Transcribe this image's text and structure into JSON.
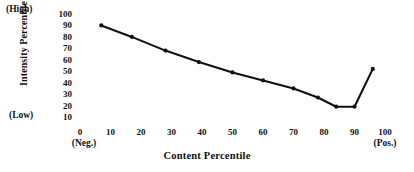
{
  "chart_data": {
    "type": "line",
    "title": "",
    "xlabel": "Content Percentile",
    "ylabel": "Intensity Percentile",
    "xlim": [
      0,
      100
    ],
    "ylim": [
      10,
      100
    ],
    "grid": false,
    "legend": false,
    "x_ticks": [
      "0",
      "10",
      "20",
      "30",
      "40",
      "50",
      "60",
      "70",
      "80",
      "90",
      "100"
    ],
    "y_ticks": [
      "100",
      "90",
      "80",
      "70",
      "60",
      "50",
      "40",
      "30",
      "20",
      "10"
    ],
    "y_axis_high_label": "(High)",
    "y_axis_low_label": "(Low)",
    "x_axis_start_label": "(Neg.)",
    "x_axis_end_label": "(Pos.)",
    "series": [
      {
        "name": "Intensity vs Content",
        "color": "#111111",
        "marker": "dot",
        "x": [
          7,
          17,
          28,
          39,
          50,
          60,
          70,
          78,
          84,
          90,
          96
        ],
        "values": [
          90,
          80,
          68,
          58,
          49,
          42,
          35,
          27,
          19,
          19,
          52
        ]
      }
    ]
  },
  "axis": {
    "y_title": "Intensity Percentile",
    "x_title": "Content Percentile",
    "high": "(High)",
    "low": "(Low)",
    "neg": "(Neg.)",
    "pos": "(Pos.)"
  }
}
